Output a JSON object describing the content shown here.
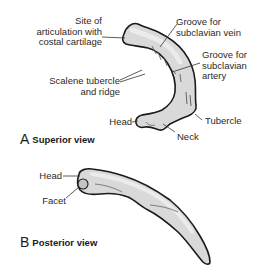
{
  "figure": {
    "colors": {
      "bone_fill": "#d9d9d9",
      "bone_highlight": "#ececec",
      "outline": "#1a1a1a",
      "leader_line": "#333333",
      "text": "#2a2a2a"
    },
    "panel_a": {
      "letter": "A",
      "title": "Superior view",
      "labels": {
        "articulation": "Site of\narticulation with\ncostal cartilage",
        "scalene": "Scalene tubercle\nand ridge",
        "head": "Head",
        "vein": "Groove for\nsubclavian vein",
        "artery": "Groove for\nsubclavian\nartery",
        "tubercle": "Tubercle",
        "neck": "Neck"
      }
    },
    "panel_b": {
      "letter": "B",
      "title": "Posterior view",
      "labels": {
        "head": "Head",
        "facet": "Facet"
      }
    }
  }
}
